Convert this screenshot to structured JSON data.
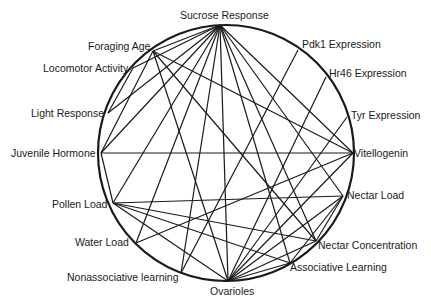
{
  "diagram": {
    "type": "circular-network",
    "circle": {
      "cx": 226,
      "cy": 153,
      "r": 128,
      "stroke": "#1a1a1a"
    },
    "nodes": [
      {
        "id": "sucrose",
        "label": "Sucrose Response",
        "x": 220,
        "y": 25,
        "lx": 180,
        "ly": 9
      },
      {
        "id": "pdk1",
        "label": "Pdk1 Expression",
        "x": 298,
        "y": 50,
        "lx": 302,
        "ly": 38
      },
      {
        "id": "hr46",
        "label": "Hr46 Expression",
        "x": 326,
        "y": 77,
        "lx": 329,
        "ly": 67
      },
      {
        "id": "tyr",
        "label": "Tyr Expression",
        "x": 347,
        "y": 117,
        "lx": 351,
        "ly": 109
      },
      {
        "id": "vitellogenin",
        "label": "Vitellogenin",
        "x": 353,
        "y": 153,
        "lx": 354,
        "ly": 147
      },
      {
        "id": "nectar_load",
        "label": "Nectar Load",
        "x": 343,
        "y": 196,
        "lx": 347,
        "ly": 189
      },
      {
        "id": "nectar_conc",
        "label": "Nectar Concentration",
        "x": 316,
        "y": 241,
        "lx": 318,
        "ly": 239
      },
      {
        "id": "assoc",
        "label": "Associative Learning",
        "x": 290,
        "y": 263,
        "lx": 290,
        "ly": 261
      },
      {
        "id": "ovarioles",
        "label": "Ovarioles",
        "x": 228,
        "y": 281,
        "lx": 210,
        "ly": 285
      },
      {
        "id": "nonassoc",
        "label": "Nonassociative learning",
        "x": 181,
        "y": 273,
        "lx": 67,
        "ly": 271
      },
      {
        "id": "water",
        "label": "Water Load",
        "x": 136,
        "y": 243,
        "lx": 75,
        "ly": 236
      },
      {
        "id": "pollen",
        "label": "Pollen Load",
        "x": 113,
        "y": 203,
        "lx": 52,
        "ly": 198
      },
      {
        "id": "jh",
        "label": "Juvenile Hormone",
        "x": 101,
        "y": 153,
        "lx": 11,
        "ly": 147
      },
      {
        "id": "light",
        "label": "Light Response",
        "x": 108,
        "y": 113,
        "lx": 31,
        "ly": 107
      },
      {
        "id": "locomotor",
        "label": "Locomotor Activity",
        "x": 133,
        "y": 68,
        "lx": 43,
        "ly": 62
      },
      {
        "id": "foraging",
        "label": "Foraging Age",
        "x": 153,
        "y": 51,
        "lx": 88,
        "ly": 40
      }
    ],
    "edges": [
      [
        "sucrose",
        "foraging"
      ],
      [
        "sucrose",
        "locomotor"
      ],
      [
        "sucrose",
        "light"
      ],
      [
        "sucrose",
        "jh"
      ],
      [
        "sucrose",
        "pollen"
      ],
      [
        "sucrose",
        "water"
      ],
      [
        "sucrose",
        "nonassoc"
      ],
      [
        "sucrose",
        "ovarioles"
      ],
      [
        "sucrose",
        "assoc"
      ],
      [
        "sucrose",
        "nectar_conc"
      ],
      [
        "sucrose",
        "nectar_load"
      ],
      [
        "sucrose",
        "vitellogenin"
      ],
      [
        "foraging",
        "vitellogenin"
      ],
      [
        "foraging",
        "jh"
      ],
      [
        "foraging",
        "ovarioles"
      ],
      [
        "foraging",
        "nectar_conc"
      ],
      [
        "locomotor",
        "light"
      ],
      [
        "pdk1",
        "nonassoc"
      ],
      [
        "hr46",
        "ovarioles"
      ],
      [
        "tyr",
        "ovarioles"
      ],
      [
        "vitellogenin",
        "jh"
      ],
      [
        "vitellogenin",
        "ovarioles"
      ],
      [
        "vitellogenin",
        "water"
      ],
      [
        "nectar_load",
        "pollen"
      ],
      [
        "nectar_load",
        "ovarioles"
      ],
      [
        "nectar_load",
        "nectar_conc"
      ],
      [
        "nectar_load",
        "assoc"
      ],
      [
        "pollen",
        "jh"
      ],
      [
        "pollen",
        "nectar_conc"
      ],
      [
        "pollen",
        "assoc"
      ],
      [
        "pollen",
        "ovarioles"
      ],
      [
        "ovarioles",
        "assoc"
      ],
      [
        "ovarioles",
        "nectar_conc"
      ]
    ]
  }
}
